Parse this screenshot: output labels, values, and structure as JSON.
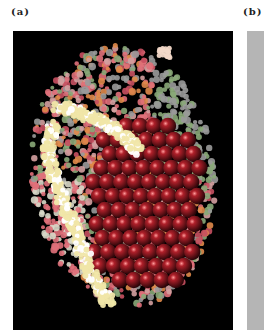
{
  "figure": {
    "panels": [
      {
        "id": "a",
        "label": "(a)",
        "description": "Space-filling molecular model of a virus-like particle on black background",
        "background_color": "#000000",
        "colors": {
          "core_spheres": "#b0202a",
          "core_highlight": "#ff9a9a",
          "band": "#f0e6a8",
          "outer_pink": "#e0707a",
          "outer_orange": "#e08a4a",
          "outer_green": "#8aa878",
          "outer_grey": "#9a9a9a"
        }
      },
      {
        "id": "b",
        "label": "(b)",
        "description": "Gray panel (cropped)",
        "background_color": "#b5b5b5"
      }
    ]
  }
}
